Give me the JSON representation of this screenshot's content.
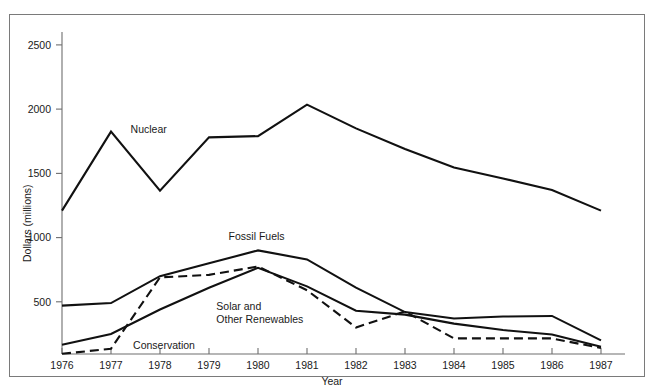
{
  "chart_data": {
    "type": "line",
    "title": "",
    "xlabel": "Year",
    "ylabel": "Dollars (millions)",
    "categories": [
      1976,
      1977,
      1978,
      1979,
      1980,
      1981,
      1982,
      1983,
      1984,
      1985,
      1986,
      1987
    ],
    "x": [
      1976,
      1977,
      1978,
      1979,
      1980,
      1981,
      1982,
      1983,
      1984,
      1985,
      1986,
      1987
    ],
    "xlim": [
      1976,
      1987
    ],
    "ylim": [
      0,
      2700
    ],
    "yticks": [
      500,
      1000,
      1500,
      2000,
      2500
    ],
    "ytick_labels": [
      "500",
      "1000",
      "1500",
      "2000",
      "2500"
    ],
    "xtick_labels": [
      "1976",
      "1977",
      "1978",
      "1979",
      "1980",
      "1981",
      "1982",
      "1983",
      "1984",
      "1985",
      "1986",
      "1987"
    ],
    "grid": false,
    "legend": "inline-annotations",
    "series": [
      {
        "name": "Nuclear",
        "style": "solid",
        "label_x": 1977.4,
        "label_y": 1815,
        "values": [
          1210,
          1825,
          1365,
          1780,
          1790,
          2035,
          1850,
          1690,
          1545,
          1460,
          1370,
          1210
        ]
      },
      {
        "name": "Fossil Fuels",
        "style": "solid",
        "label_x": 1979.4,
        "label_y": 985,
        "values": [
          470,
          490,
          700,
          800,
          900,
          830,
          610,
          420,
          370,
          385,
          390,
          200
        ]
      },
      {
        "name": "Solar and Other Renewables",
        "style": "solid",
        "label_x": 1979.15,
        "label_y": 440,
        "values": [
          165,
          250,
          440,
          610,
          765,
          620,
          430,
          400,
          330,
          280,
          245,
          150
        ]
      },
      {
        "name": "Conservation",
        "style": "dashed",
        "label_x": 1977.45,
        "label_y": 130,
        "values": [
          95,
          135,
          690,
          710,
          775,
          590,
          300,
          425,
          215,
          215,
          215,
          140
        ]
      }
    ]
  },
  "axes": {
    "y_axis_title": "Dollars (millions)",
    "x_axis_title": "Year"
  }
}
